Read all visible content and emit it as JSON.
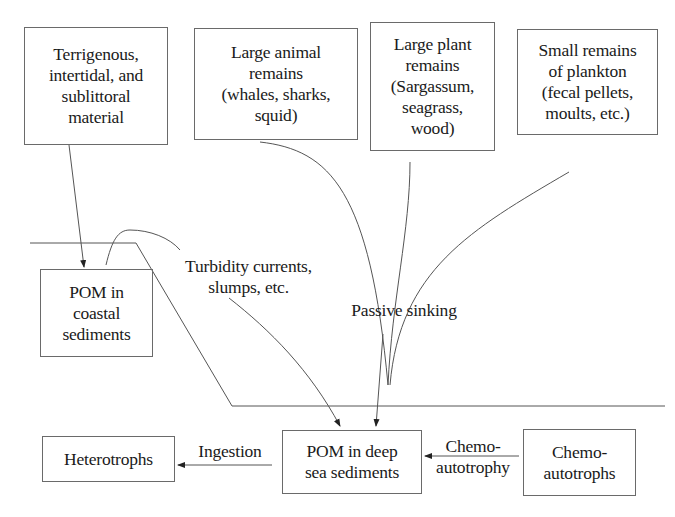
{
  "diagram": {
    "sources": [
      {
        "id": "terrigenous",
        "label": "Terrigenous,\nintertidal, and\nsublittoral\nmaterial"
      },
      {
        "id": "large-animal",
        "label": "Large animal\nremains\n(whales, sharks,\nsquid)"
      },
      {
        "id": "large-plant",
        "label": "Large plant\nremains\n(Sargassum,\nseagrass,\nwood)"
      },
      {
        "id": "small-plankton",
        "label": "Small remains\nof plankton\n(fecal pellets,\nmoults, etc.)"
      }
    ],
    "nodes": {
      "pom_coastal": "POM in\ncoastal\nsediments",
      "pom_deep": "POM in deep\nsea sediments",
      "heterotrophs": "Heterotrophs",
      "chemoautotrophs": "Chemo-\nautotrophs"
    },
    "process_labels": {
      "turbidity": "Turbidity currents,\nslumps, etc.",
      "passive_sinking": "Passive sinking",
      "ingestion": "Ingestion",
      "chemoautotrophy": "Chemo-\nautotrophy"
    },
    "edges": [
      {
        "from": "terrigenous",
        "to": "pom_coastal",
        "label": ""
      },
      {
        "from": "pom_coastal",
        "to": "pom_deep",
        "label": "Turbidity currents, slumps, etc."
      },
      {
        "from": "large-animal",
        "to": "pom_deep",
        "label": "Passive sinking"
      },
      {
        "from": "large-plant",
        "to": "pom_deep",
        "label": "Passive sinking"
      },
      {
        "from": "small-plankton",
        "to": "pom_deep",
        "label": "Passive sinking"
      },
      {
        "from": "pom_deep",
        "to": "heterotrophs",
        "label": "Ingestion"
      },
      {
        "from": "chemoautotrophs",
        "to": "pom_deep",
        "label": "Chemo-autotrophy"
      }
    ],
    "colors": {
      "line": "#555555",
      "border": "#6a6a6a",
      "text": "#1a1a1a",
      "background": "#ffffff"
    }
  }
}
